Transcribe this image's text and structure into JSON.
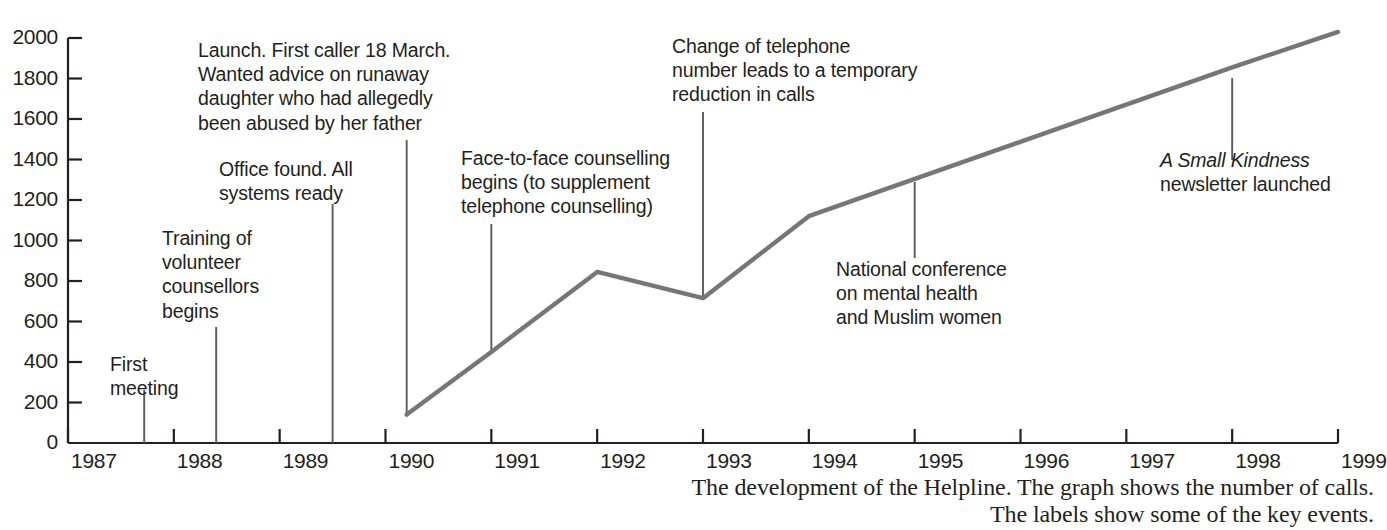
{
  "chart_data": {
    "type": "line",
    "title": "",
    "xlabel": "",
    "ylabel": "",
    "xlim": [
      1987,
      1999
    ],
    "ylim": [
      0,
      2000
    ],
    "grid": false,
    "legend": "none",
    "line_color": "#767676",
    "axis_color": "#231f20",
    "x_ticks": [
      "1987",
      "1988",
      "1989",
      "1990",
      "1991",
      "1992",
      "1993",
      "1994",
      "1995",
      "1996",
      "1997",
      "1998",
      "1999"
    ],
    "y_ticks": [
      "0",
      "200",
      "400",
      "600",
      "800",
      "1000",
      "1200",
      "1400",
      "1600",
      "1800",
      "2000"
    ],
    "series": [
      {
        "name": "Number of calls",
        "x": [
          1990.2,
          1991.0,
          1992.0,
          1993.0,
          1994.0,
          1998.0,
          1999.0
        ],
        "values": [
          140,
          450,
          845,
          715,
          1120,
          1855,
          2030
        ]
      }
    ],
    "annotations": [
      {
        "id": "first-meeting",
        "text": "First\nmeeting",
        "x": 1987.72,
        "leader_top": 390,
        "leader_bottom": 443
      },
      {
        "id": "training-of-volunteer-counsellors-begins",
        "text": "Training of\nvolunteer\ncounsellors\nbegins",
        "x": 1988.4,
        "leader_top": 327,
        "leader_bottom": 443
      },
      {
        "id": "office-found-all-systems-ready",
        "text": "Office found.  All\nsystems ready",
        "x": 1989.5,
        "leader_top": 204,
        "leader_bottom": 443
      },
      {
        "id": "launch-first-caller",
        "text": "Launch. First caller 18 March.\nWanted advice on runaway\ndaughter who had allegedly\nbeen abused by her father",
        "x": 1990.2,
        "leader_top": 140,
        "leader_bottom": 415
      },
      {
        "id": "face-to-face-counselling-begins",
        "text": "Face-to-face counselling\nbegins (to supplement\ntelephone counselling)",
        "x": 1991.0,
        "leader_top": 224,
        "leader_bottom": 353
      },
      {
        "id": "change-of-telephone-number",
        "text": "Change of telephone\nnumber leads to a temporary\nreduction in calls",
        "x": 1993.0,
        "leader_top": 112,
        "leader_bottom": 298
      },
      {
        "id": "national-conference",
        "text": "National conference\non mental health\nand Muslim women",
        "x": 1995.0,
        "leader_top": 182,
        "leader_bottom": 258
      },
      {
        "id": "a-small-kindness-newsletter",
        "text_italic": "A Small Kindness",
        "text": "newsletter launched",
        "x": 1998.0,
        "leader_top": 78,
        "leader_bottom": 160
      }
    ]
  },
  "caption": {
    "line1": "The development of the Helpline. The graph shows the number of calls.",
    "line2": "The labels show some of the key events."
  }
}
